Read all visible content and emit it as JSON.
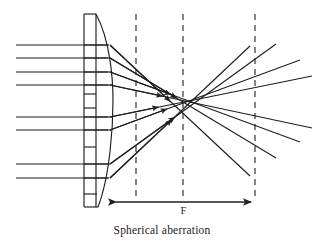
{
  "figure": {
    "caption": "Spherical aberration",
    "focal_label": "F",
    "title": "Spherical aberration"
  },
  "colors": {
    "stroke": "#1f1f1f",
    "background": "#ffffff",
    "dashed": "#2a2a2a"
  },
  "diagram_data": {
    "type": "ray-optics-diagram",
    "description": "Parallel light rays entering a thick lens from the left are refracted; outer (marginal) rays cross the optical axis closer to the lens than the inner (paraxial) rays, producing a spread of focal points rather than a single point — spherical aberration.",
    "canvas": {
      "width": 324,
      "height": 247
    },
    "optical_axis_y": 101,
    "lens": {
      "shape": "thick biconvex lens drawn as tall lens-shaped outline with internal horizontal ray-entry partitions",
      "left_x": 84,
      "right_x": 112,
      "apex_x": 112,
      "top_y": 14,
      "bottom_y": 207,
      "internal_divider_count": 10
    },
    "incoming_rays": {
      "count": 8,
      "start_x": 16,
      "hit_x": 108,
      "y_values": [
        45,
        58,
        72,
        85,
        117,
        130,
        164,
        178
      ],
      "parallel": true,
      "direction": "left-to-right"
    },
    "refracted_rays": {
      "count": 8,
      "note": "each refracted ray starts at the lens exit face and crosses the axis at a different distance; marginal rays cross first",
      "segments": [
        {
          "x1": 110,
          "y1": 45,
          "x2": 250,
          "y2": 176,
          "arrow_at": 0.43
        },
        {
          "x1": 110,
          "y1": 58,
          "x2": 276,
          "y2": 158,
          "arrow_at": 0.4
        },
        {
          "x1": 110,
          "y1": 72,
          "x2": 300,
          "y2": 142,
          "arrow_at": 0.32
        },
        {
          "x1": 110,
          "y1": 85,
          "x2": 312,
          "y2": 128,
          "arrow_at": 0.26
        },
        {
          "x1": 110,
          "y1": 117,
          "x2": 312,
          "y2": 76,
          "arrow_at": 0.24
        },
        {
          "x1": 110,
          "y1": 130,
          "x2": 300,
          "y2": 60,
          "arrow_at": 0.3
        },
        {
          "x1": 110,
          "y1": 164,
          "x2": 276,
          "y2": 44,
          "arrow_at": 0.39
        },
        {
          "x1": 110,
          "y1": 178,
          "x2": 250,
          "y2": 46,
          "arrow_at": 0.44
        }
      ]
    },
    "dashed_vertical_lines": {
      "count": 3,
      "x_values": [
        136,
        183,
        255
      ],
      "top_y": 14,
      "bottom_y": 200,
      "meaning": "reference planes showing the spread of focal positions"
    },
    "focal_dimension_arrow": {
      "y": 202,
      "x_start": 112,
      "x_end": 255,
      "double_headed": true,
      "label": "F"
    },
    "axis_ranges": {
      "x": [
        0,
        324
      ],
      "y": [
        0,
        247
      ]
    },
    "grid": false,
    "legend": null
  }
}
